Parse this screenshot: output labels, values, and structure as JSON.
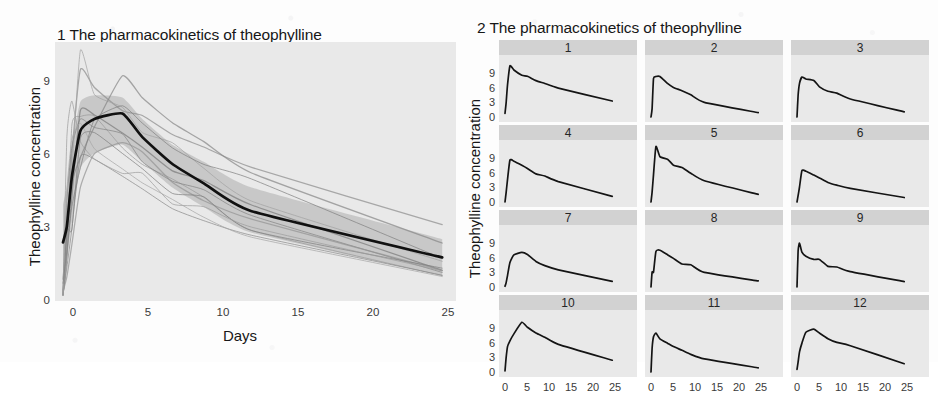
{
  "figure_background": "#fdfdfd",
  "panel_background": "#e9e9e9",
  "strip_background": "#d2d2d2",
  "ink_color": "#1a1a1a",
  "ribbon_color": "#9a9a9a",
  "panel1": {
    "title": "1 The pharmacokinetics of theophylline",
    "ylabel": "Theophylline concentration",
    "xlabel": "Days",
    "y_ticks": [
      "0",
      "3",
      "6",
      "9"
    ],
    "x_ticks": [
      "0",
      "5",
      "10",
      "15",
      "20",
      "25"
    ]
  },
  "panel2": {
    "title": "2 The pharmacokinetics of theophylline",
    "ylabel": "Theophylline concentration",
    "xlabel": "Patients",
    "y_ticks": [
      "0",
      "3",
      "6",
      "9"
    ],
    "x_ticks": [
      "0",
      "5",
      "10",
      "15",
      "20",
      "25"
    ],
    "strips": [
      "1",
      "2",
      "3",
      "4",
      "5",
      "6",
      "7",
      "8",
      "9",
      "10",
      "11",
      "12"
    ]
  },
  "chart_data": [
    {
      "id": "panel1",
      "type": "line",
      "title": "1 The pharmacokinetics of theophylline",
      "xlabel": "Days",
      "ylabel": "Theophylline concentration",
      "xlim": [
        0,
        25
      ],
      "ylim": [
        0,
        11.5
      ],
      "xticks": [
        0,
        5,
        10,
        15,
        20,
        25
      ],
      "yticks": [
        0,
        3,
        6,
        9
      ],
      "grid": false,
      "legend": "none",
      "description": "Spaghetti plot of 12 subject concentration-time profiles with a bold mean curve and a shaded confidence ribbon.",
      "x": [
        0,
        0.25,
        0.57,
        1.12,
        2.02,
        3.82,
        5.1,
        7.03,
        9.05,
        12.12,
        24.37
      ],
      "series": [
        {
          "name": "1",
          "style": "thin-grey",
          "values": [
            0.74,
            2.84,
            6.57,
            10.5,
            9.66,
            8.58,
            8.36,
            7.47,
            6.89,
            5.94,
            3.28
          ]
        },
        {
          "name": "2",
          "style": "thin-grey",
          "values": [
            0.0,
            1.72,
            7.91,
            8.31,
            8.33,
            6.85,
            6.08,
            5.4,
            4.55,
            3.01,
            0.9
          ]
        },
        {
          "name": "3",
          "style": "thin-grey",
          "values": [
            0.0,
            4.4,
            6.9,
            8.2,
            7.8,
            7.5,
            6.2,
            5.3,
            4.9,
            3.7,
            1.05
          ]
        },
        {
          "name": "4",
          "style": "thin-grey",
          "values": [
            0.0,
            1.89,
            4.6,
            8.6,
            8.38,
            7.54,
            6.88,
            5.78,
            5.33,
            4.19,
            1.15
          ]
        },
        {
          "name": "5",
          "style": "thin-grey",
          "values": [
            0.0,
            2.02,
            5.63,
            11.4,
            9.33,
            8.74,
            7.56,
            7.09,
            5.9,
            4.37,
            1.57
          ]
        },
        {
          "name": "6",
          "style": "thin-grey",
          "values": [
            0.0,
            1.29,
            3.08,
            6.44,
            6.32,
            5.53,
            4.94,
            4.02,
            3.46,
            2.78,
            0.92
          ]
        },
        {
          "name": "7",
          "style": "thin-grey",
          "values": [
            0.15,
            0.85,
            2.35,
            5.02,
            6.58,
            7.09,
            6.66,
            5.25,
            4.39,
            3.53,
            1.15
          ]
        },
        {
          "name": "8",
          "style": "thin-grey",
          "values": [
            0.0,
            3.05,
            3.05,
            7.31,
            7.56,
            6.59,
            5.88,
            4.73,
            4.57,
            3.0,
            1.25
          ]
        },
        {
          "name": "9",
          "style": "thin-grey",
          "values": [
            0.0,
            7.37,
            9.03,
            7.14,
            6.33,
            5.66,
            5.67,
            4.24,
            4.11,
            3.16,
            1.12
          ]
        },
        {
          "name": "10",
          "style": "thin-grey",
          "values": [
            0.24,
            2.89,
            5.22,
            6.41,
            7.83,
            10.21,
            9.18,
            8.02,
            7.14,
            5.68,
            2.42
          ]
        },
        {
          "name": "11",
          "style": "thin-grey",
          "values": [
            0.0,
            4.86,
            7.24,
            8.0,
            6.81,
            5.87,
            5.22,
            4.45,
            3.62,
            2.69,
            0.86
          ]
        },
        {
          "name": "12",
          "style": "thin-grey",
          "values": [
            0.55,
            2.05,
            4.12,
            5.93,
            8.17,
            8.81,
            8.0,
            6.85,
            6.08,
            5.4,
            1.7
          ]
        },
        {
          "name": "mean",
          "style": "bold-black",
          "values": [
            2.45,
            3.2,
            5.5,
            7.65,
            8.2,
            8.45,
            7.35,
            6.1,
            5.2,
            3.9,
            1.75
          ]
        }
      ],
      "ribbon": {
        "name": "confidence band",
        "upper": [
          4.2,
          5.1,
          7.0,
          9.0,
          9.3,
          9.2,
          8.2,
          7.0,
          6.2,
          5.0,
          2.6
        ],
        "lower": [
          1.0,
          1.6,
          3.4,
          5.9,
          6.6,
          7.0,
          6.2,
          5.0,
          4.1,
          2.9,
          0.9
        ]
      }
    },
    {
      "id": "panel2",
      "type": "line",
      "title": "2 The pharmacokinetics of theophylline",
      "xlabel": "Patients",
      "ylabel": "Theophylline concentration",
      "xlim": [
        0,
        25
      ],
      "ylim": [
        0,
        11.5
      ],
      "xticks": [
        0,
        5,
        10,
        15,
        20,
        25
      ],
      "yticks": [
        0,
        3,
        6,
        9
      ],
      "grid": false,
      "legend": "none",
      "facet": {
        "rows": 4,
        "cols": 3,
        "strip_position": "top"
      },
      "description": "3x4 small-multiples grid, one concentration-time curve per patient (1-12).",
      "x": [
        0,
        0.25,
        0.57,
        1.12,
        2.02,
        3.82,
        5.1,
        7.03,
        9.05,
        12.12,
        24.37
      ],
      "facets": [
        {
          "name": "1",
          "values": [
            0.74,
            2.84,
            6.57,
            10.5,
            9.66,
            8.58,
            8.36,
            7.47,
            6.89,
            5.94,
            3.28
          ]
        },
        {
          "name": "2",
          "values": [
            0.0,
            1.72,
            7.91,
            8.31,
            8.33,
            6.85,
            6.08,
            5.4,
            4.55,
            3.01,
            0.9
          ]
        },
        {
          "name": "3",
          "values": [
            0.0,
            4.4,
            6.9,
            8.2,
            7.8,
            7.5,
            6.2,
            5.3,
            4.9,
            3.7,
            1.05
          ]
        },
        {
          "name": "4",
          "values": [
            0.0,
            1.89,
            4.6,
            8.6,
            8.38,
            7.54,
            6.88,
            5.78,
            5.33,
            4.19,
            1.15
          ]
        },
        {
          "name": "5",
          "values": [
            0.0,
            2.02,
            5.63,
            11.4,
            9.33,
            8.74,
            7.56,
            7.09,
            5.9,
            4.37,
            1.57
          ]
        },
        {
          "name": "6",
          "values": [
            0.0,
            1.29,
            3.08,
            6.44,
            6.32,
            5.53,
            4.94,
            4.02,
            3.46,
            2.78,
            0.92
          ]
        },
        {
          "name": "7",
          "values": [
            0.15,
            0.85,
            2.35,
            5.02,
            6.58,
            7.09,
            6.66,
            5.25,
            4.39,
            3.53,
            1.15
          ]
        },
        {
          "name": "8",
          "values": [
            0.0,
            3.05,
            3.05,
            7.31,
            7.56,
            6.59,
            5.88,
            4.73,
            4.57,
            3.0,
            1.25
          ]
        },
        {
          "name": "9",
          "values": [
            0.0,
            7.37,
            9.03,
            7.14,
            6.33,
            5.66,
            5.67,
            4.24,
            4.11,
            3.16,
            1.12
          ]
        },
        {
          "name": "10",
          "values": [
            0.24,
            2.89,
            5.22,
            6.41,
            7.83,
            10.21,
            9.18,
            8.02,
            7.14,
            5.68,
            2.42
          ]
        },
        {
          "name": "11",
          "values": [
            0.0,
            4.86,
            7.24,
            8.0,
            6.81,
            5.87,
            5.22,
            4.45,
            3.62,
            2.69,
            0.86
          ]
        },
        {
          "name": "12",
          "values": [
            0.55,
            2.05,
            4.12,
            5.93,
            8.17,
            8.81,
            8.0,
            6.85,
            6.08,
            5.4,
            1.7
          ]
        }
      ]
    }
  ]
}
